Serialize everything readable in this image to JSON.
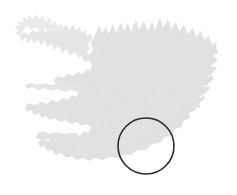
{
  "figure": {
    "kind": "map",
    "subject": "Iceland",
    "width": 237,
    "height": 195,
    "background_color": "#ffffff",
    "has_visible_text": false,
    "title": "",
    "caption": ""
  },
  "map": {
    "name": "iceland-silhouette",
    "region_label": "Iceland",
    "projection_hint": "plain outline silhouette, north up",
    "land": {
      "fill_color": "#e3e3e3",
      "edge_color": "#e3e3e3",
      "texture": "fine grainy noise",
      "bounds": {
        "x": 18,
        "y": 16,
        "width": 200,
        "height": 156
      }
    },
    "ocean": {
      "fill_color": "#ffffff"
    },
    "sub_regions": [
      {
        "name": "westfjords-peninsula",
        "label": "Westfjords",
        "position": "northwest"
      },
      {
        "name": "snaefellsnes-peninsula",
        "label": "Snaefellsnes",
        "position": "west"
      },
      {
        "name": "reykjanes-peninsula",
        "label": "Reykjanes",
        "position": "southwest"
      },
      {
        "name": "north-coast-fjords",
        "label": "North coast",
        "position": "north"
      },
      {
        "name": "east-fjords",
        "label": "East fjords",
        "position": "east"
      },
      {
        "name": "south-coast",
        "label": "South coast",
        "position": "south"
      }
    ]
  },
  "annotation": {
    "name": "highlight-circle",
    "shape": "circle",
    "stroke_color": "#2b2b2b",
    "stroke_width": 1.6,
    "fill": "none",
    "center_x": 146,
    "center_y": 146,
    "radius": 28,
    "target_region": "southeast coast",
    "label": ""
  }
}
